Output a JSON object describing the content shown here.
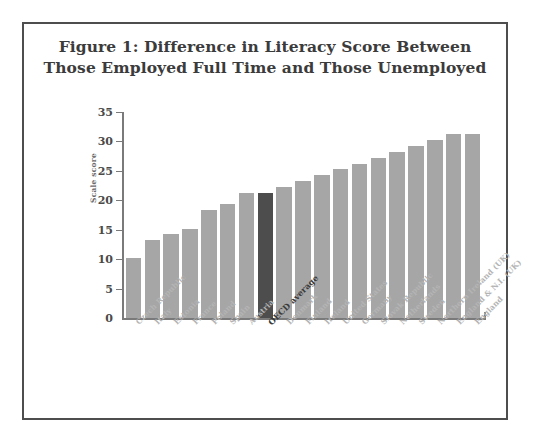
{
  "figure": {
    "title_line1": "Figure 1: Difference in Literacy Score Between",
    "title_line2": "Those Employed Full Time and Those Unemployed"
  },
  "colors": {
    "bar": "#a6a6a6",
    "bar_highlight": "#4d4d4d",
    "axis": "#7a7a7a",
    "frame": "#4e4e4e",
    "label": "#b4b4b4",
    "label_emphasis": "#3a3a3a"
  },
  "chart_data": {
    "type": "bar",
    "title": "Figure 1: Difference in Literacy Score Between Those Employed Full Time and Those Unemployed",
    "xlabel": "",
    "ylabel": "Scale score",
    "ylim": [
      0,
      35
    ],
    "yticks": [
      0,
      5,
      10,
      15,
      20,
      25,
      30,
      35
    ],
    "ytick_labels": [
      "0",
      "5",
      "10",
      "15",
      "20",
      "25",
      "30",
      "35"
    ],
    "grid": false,
    "legend": "none",
    "highlight_category": "OECD average",
    "categories": [
      "Czech Republic",
      "Italy",
      "Estonia",
      "France",
      "Poland",
      "Spain",
      "Austria",
      "OECD average",
      "Denmark",
      "Finland",
      "Ireland",
      "United States",
      "Germany",
      "Slovak Republic",
      "Netherlands",
      "Sweden",
      "Northern Ireland (UK)",
      "England & N.I. (UK)",
      "England"
    ],
    "values": [
      10.2,
      13.3,
      14.3,
      15.2,
      18.3,
      19.3,
      21.2,
      21.2,
      22.3,
      23.2,
      24.3,
      25.3,
      26.2,
      27.2,
      28.2,
      29.3,
      30.2,
      31.3,
      31.3
    ]
  }
}
